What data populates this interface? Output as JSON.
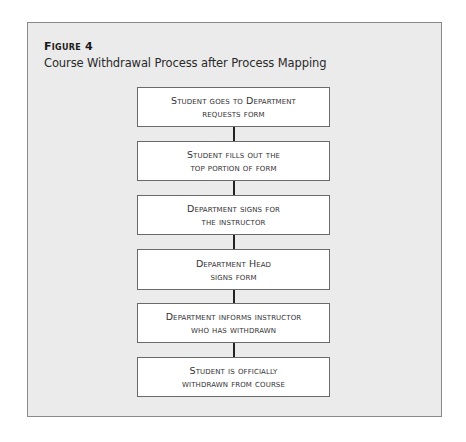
{
  "figure": {
    "label": "Figure 4",
    "title": "Course Withdrawal Process after Process Mapping"
  },
  "colors": {
    "frame_background": "#ebebeb",
    "frame_border": "#8a8a8a",
    "box_background": "#ffffff",
    "box_border": "#6a6a6a",
    "connector": "#222222"
  },
  "steps": [
    {
      "line1": "Student goes to Department",
      "line2": "requests form"
    },
    {
      "line1": "Student fills out the",
      "line2": "top portion of form"
    },
    {
      "line1": "Department signs for",
      "line2": "the instructor"
    },
    {
      "line1": "Department Head",
      "line2": "signs form"
    },
    {
      "line1": "Department informs instructor",
      "line2": "who has withdrawn"
    },
    {
      "line1": "Student is officially",
      "line2": "withdrawn from course"
    }
  ]
}
